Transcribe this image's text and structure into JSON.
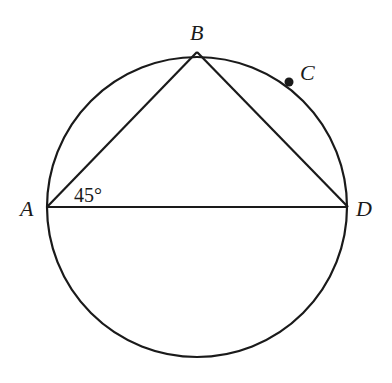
{
  "diagram": {
    "type": "circle-inscribed-triangle",
    "circle": {
      "cx": 197,
      "cy": 207,
      "r": 150
    },
    "points": [
      {
        "name": "A",
        "label": "A",
        "x": 47,
        "y": 207
      },
      {
        "name": "B",
        "label": "B",
        "x": 197,
        "y": 52
      },
      {
        "name": "C",
        "label": "C",
        "x": 289,
        "y": 82
      },
      {
        "name": "D",
        "label": "D",
        "x": 348,
        "y": 207
      }
    ],
    "segments": [
      [
        "A",
        "B"
      ],
      [
        "B",
        "D"
      ],
      [
        "A",
        "D"
      ]
    ],
    "angle_label": {
      "vertex": "A",
      "text": "45°"
    },
    "colors": {
      "line": "#1a1a1a",
      "background": "#ffffff"
    }
  }
}
